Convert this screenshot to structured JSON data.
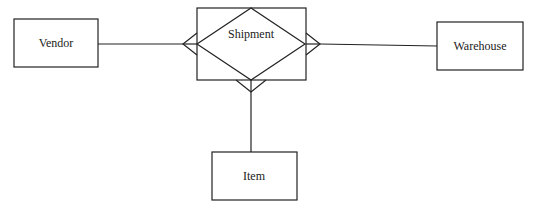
{
  "diagram": {
    "type": "er-diagram",
    "colors": {
      "stroke": "#222222",
      "background": "#ffffff",
      "text": "#222222"
    },
    "entities": [
      {
        "id": "vendor",
        "label": "Vendor"
      },
      {
        "id": "warehouse",
        "label": "Warehouse"
      },
      {
        "id": "item",
        "label": "Item"
      }
    ],
    "relationship": {
      "id": "shipment",
      "label": "Shipment",
      "style": "associative-entity (diamond in rectangle)"
    },
    "connections": [
      {
        "from": "vendor",
        "to": "shipment",
        "cardinality_at_shipment": "many (crow's foot)"
      },
      {
        "from": "warehouse",
        "to": "shipment",
        "cardinality_at_shipment": "many (crow's foot)"
      },
      {
        "from": "item",
        "to": "shipment",
        "cardinality_at_shipment": "many (crow's foot)"
      }
    ]
  }
}
